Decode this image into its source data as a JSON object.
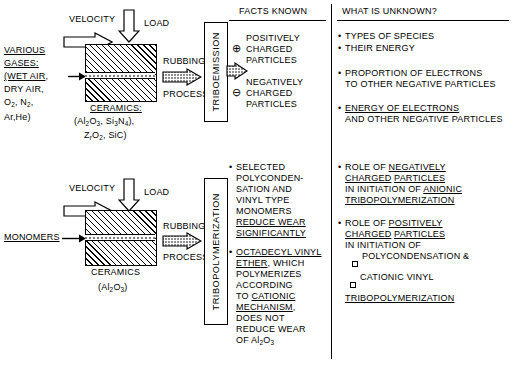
{
  "columns": {
    "facts_known": "FACTS KNOWN",
    "what_is_unknown": "WHAT IS UNKNOWN?"
  },
  "top": {
    "velocity_label": "VELOCITY",
    "load_label": "LOAD",
    "rubbing_label": "RUBBING",
    "process_label": "PROCESS",
    "inputs": {
      "line1": "VARIOUS",
      "line2": "GASES:",
      "line3": "(WET AIR,",
      "line4": "DRY AIR,",
      "line5": "O2, N2,",
      "line6": "Ar,He)"
    },
    "specimen": {
      "line1": "CERAMICS:",
      "line2": "(Al2O3, Si3N4),",
      "line3": "ZrO2, SiC)"
    },
    "process_box": "TRIBOEMISSION",
    "facts": [
      {
        "symbol": "positive-charge",
        "glyph": "⊕",
        "lines": [
          "POSITIVELY",
          "CHARGED",
          "PARTICLES"
        ]
      },
      {
        "symbol": "negative-charge",
        "glyph": "⊖",
        "lines": [
          "NEGATIVELY",
          "CHARGED",
          "PARTICLES"
        ]
      }
    ],
    "unknowns": [
      {
        "bullet": "•",
        "lines": [
          "TYPES OF SPECIES"
        ]
      },
      {
        "bullet": "•",
        "lines": [
          "THEIR ENERGY"
        ]
      },
      {
        "bullet": "•",
        "lines": [
          "PROPORTION OF ELECTRONS",
          "TO OTHER NEGATIVE PARTICLES"
        ]
      },
      {
        "bullet": "•",
        "lines": [
          "ENERGY OF ELECTRONS",
          "AND OTHER NEGATIVE PARTICLES"
        ]
      }
    ]
  },
  "bottom": {
    "velocity_label": "VELOCITY",
    "load_label": "LOAD",
    "rubbing_label": "RUBBING",
    "process_label": "PROCESS",
    "inputs": {
      "line1": "MONOMERS"
    },
    "specimen": {
      "line1": "CERAMICS",
      "line2": "(Al2O3)"
    },
    "process_box": "TRIBOPOLYMERIZATION",
    "facts": [
      {
        "bullet": "•",
        "lines": [
          "SELECTED",
          "POLYCONDEN-",
          "SATION AND",
          "VINYL TYPE",
          "MONOMERS",
          "REDUCE WEAR",
          "SIGNIFICANTLY"
        ]
      },
      {
        "bullet": "•",
        "lines": [
          "OCTADECYL VINYL",
          "ETHER, WHICH",
          "POLYMERIZES",
          "ACCORDING",
          "TO CATIONIC",
          "MECHANISM,",
          "DOES NOT",
          "REDUCE WEAR",
          "OF Al2O3"
        ]
      }
    ],
    "unknowns": [
      {
        "bullet": "•",
        "lines": [
          "ROLE OF NEGATIVELY",
          "CHARGED PARTICLES",
          "IN INITIATION OF ANIONIC",
          "TRIBOPOLYMERIZATION"
        ]
      },
      {
        "bullet": "•",
        "lines": [
          "ROLE OF POSITIVELY",
          "CHARGED PARTICLES",
          "IN INITIATION OF"
        ]
      },
      {
        "bullet": "square",
        "lines": [
          "POLYCONDENSATION &"
        ]
      },
      {
        "bullet": "square",
        "lines": [
          "CATIONIC VINYL"
        ]
      },
      {
        "bullet": "none",
        "lines": [
          "TRIBOPOLYMERIZATION"
        ]
      }
    ]
  },
  "colors": {
    "ink": "#000000",
    "paper": "#ffffff"
  }
}
